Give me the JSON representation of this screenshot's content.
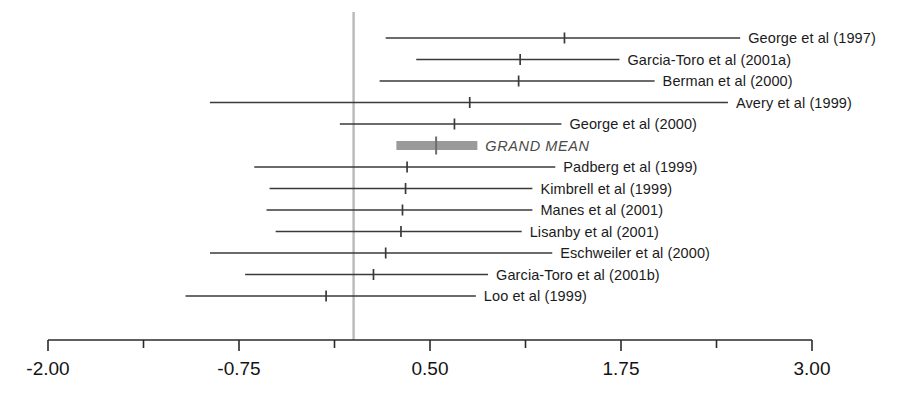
{
  "figure": {
    "type": "forest-plot",
    "reference_line_value": 0,
    "reference_line_color": "#b9b9b9",
    "line_color": "#3a3a3a",
    "grand_mean_bar_color": "#9a9a9a",
    "background": "#ffffff"
  },
  "axis": {
    "min": -2.0,
    "max": 3.0,
    "pixel_left": 48,
    "pixel_right": 812,
    "major_ticks": [
      -2.0,
      -0.75,
      0.5,
      1.75,
      3.0
    ],
    "minor_ticks": [
      -1.375,
      -0.125,
      1.125,
      2.375
    ],
    "tick_labels": [
      "-2.00",
      "-0.75",
      "0.50",
      "1.75",
      "3.00"
    ],
    "label": ""
  },
  "chart_data": {
    "type": "forest",
    "title": "",
    "xlabel": "",
    "ylabel": "",
    "xlim": [
      -2.0,
      3.0
    ],
    "grid": false,
    "legend": "none",
    "reference_line": 0,
    "x_ticks": [
      -2.0,
      -0.75,
      0.5,
      1.75,
      3.0
    ],
    "x_tick_labels": [
      "-2.00",
      "-0.75",
      "0.50",
      "1.75",
      "3.00"
    ],
    "rows": [
      {
        "label": "George et al (1997)",
        "effect": 1.38,
        "ci_low": 0.21,
        "ci_high": 2.53,
        "is_summary": false
      },
      {
        "label": "Garcia-Toro et al (2001a)",
        "effect": 1.09,
        "ci_low": 0.41,
        "ci_high": 1.74,
        "is_summary": false
      },
      {
        "label": "Berman et al (2000)",
        "effect": 1.08,
        "ci_low": 0.17,
        "ci_high": 1.97,
        "is_summary": false
      },
      {
        "label": "Avery et al (1999)",
        "effect": 0.76,
        "ci_low": -0.94,
        "ci_high": 2.45,
        "is_summary": false
      },
      {
        "label": "George et al (2000)",
        "effect": 0.66,
        "ci_low": -0.09,
        "ci_high": 1.36,
        "is_summary": false
      },
      {
        "label": "GRAND MEAN",
        "effect": 0.54,
        "ci_low": 0.28,
        "ci_high": 0.81,
        "is_summary": true
      },
      {
        "label": "Padberg et al (1999)",
        "effect": 0.35,
        "ci_low": -0.65,
        "ci_high": 1.32,
        "is_summary": false
      },
      {
        "label": "Kimbrell et al (1999)",
        "effect": 0.34,
        "ci_low": -0.55,
        "ci_high": 1.17,
        "is_summary": false
      },
      {
        "label": "Manes et al (2001)",
        "effect": 0.32,
        "ci_low": -0.57,
        "ci_high": 1.17,
        "is_summary": false
      },
      {
        "label": "Lisanby et al (2001)",
        "effect": 0.31,
        "ci_low": -0.51,
        "ci_high": 1.1,
        "is_summary": false
      },
      {
        "label": "Eschweiler et al (2000)",
        "effect": 0.21,
        "ci_low": -0.94,
        "ci_high": 1.3,
        "is_summary": false
      },
      {
        "label": "Garcia-Toro et al (2001b)",
        "effect": 0.13,
        "ci_low": -0.71,
        "ci_high": 0.88,
        "is_summary": false
      },
      {
        "label": "Loo et al (1999)",
        "effect": -0.18,
        "ci_low": -1.1,
        "ci_high": 0.8,
        "is_summary": false
      }
    ]
  }
}
